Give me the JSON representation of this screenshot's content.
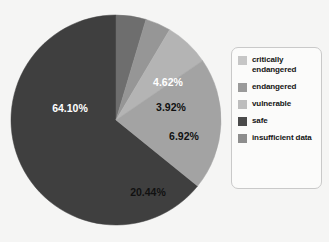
{
  "chart_data": {
    "type": "pie",
    "title": "",
    "title_truncated": true,
    "categories": [
      "safe",
      "insufficient data",
      "endangered",
      "vulnerable",
      "critically endangered"
    ],
    "values": [
      64.1,
      4.62,
      3.92,
      6.92,
      20.44
    ],
    "value_labels": [
      "64.10%",
      "4.62%",
      "3.92%",
      "6.92%",
      "20.44%"
    ],
    "unit": "%",
    "legend_position": "right",
    "grid": false,
    "slices": [
      {
        "name": "safe",
        "value": 64.1,
        "label": "64.10%",
        "color": "#3f3f3f",
        "label_color": "#ffffff",
        "start_angle": 129,
        "end_angle": 360,
        "label_x": 62,
        "label_y": 102
      },
      {
        "name": "insufficient data",
        "value": 4.62,
        "label": "4.62%",
        "color": "#6e6e6e",
        "label_color": "#ffffff",
        "start_angle": 0,
        "end_angle": 16.6,
        "label_x": 160,
        "label_y": 76
      },
      {
        "name": "endangered",
        "value": 3.92,
        "label": "3.92%",
        "color": "#969696",
        "label_color": "#111111",
        "start_angle": 16.6,
        "end_angle": 30.7,
        "label_x": 163,
        "label_y": 101
      },
      {
        "name": "vulnerable",
        "value": 6.92,
        "label": "6.92%",
        "color": "#b4b4b4",
        "label_color": "#111111",
        "start_angle": 30.7,
        "end_angle": 55.6,
        "label_x": 176,
        "label_y": 130
      },
      {
        "name": "critically endangered",
        "value": 20.44,
        "label": "20.44%",
        "color": "#a3a3a3",
        "label_color": "#111111",
        "start_angle": 55.6,
        "end_angle": 129,
        "label_x": 140,
        "label_y": 186
      }
    ],
    "legend": [
      {
        "label": "critically endangered",
        "color": "#c6c6c6"
      },
      {
        "label": "endangered",
        "color": "#9a9a9a"
      },
      {
        "label": "vulnerable",
        "color": "#bdbdbd"
      },
      {
        "label": "safe",
        "color": "#4a4a4a"
      },
      {
        "label": "insufficient data",
        "color": "#8d8d8d"
      }
    ],
    "colors": {
      "background": "#f5f5f4",
      "legend_background": "#fbfbfa",
      "legend_border": "#c9c9c9",
      "text": "#141414"
    }
  }
}
